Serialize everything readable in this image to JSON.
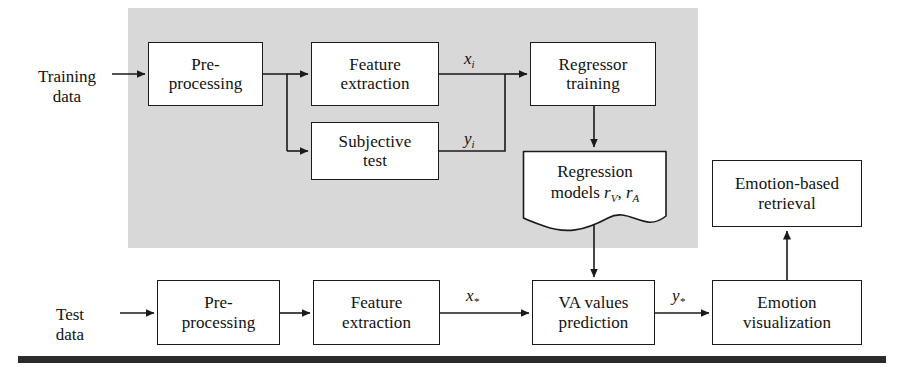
{
  "figure": {
    "type": "flowchart",
    "background_color": "#ffffff",
    "training_region_color": "#d8d8d8",
    "line_color": "#1a1a1a"
  },
  "regions": [
    {
      "id": "training-region",
      "label": "training phase shaded area",
      "x": 128,
      "y": 8,
      "w": 570,
      "h": 240
    }
  ],
  "nodes": [
    {
      "id": "pre-processing-training",
      "label": "Pre-\nprocessing",
      "line1": "Pre-",
      "line2": "processing",
      "shape": "rect",
      "x": 148,
      "y": 42,
      "w": 115,
      "h": 64
    },
    {
      "id": "feature-extraction-training",
      "label": "Feature\nextraction",
      "line1": "Feature",
      "line2": "extraction",
      "shape": "rect",
      "x": 311,
      "y": 42,
      "w": 128,
      "h": 64
    },
    {
      "id": "subjective-test",
      "label": "Subjective\ntest",
      "line1": "Subjective",
      "line2": "test",
      "shape": "rect",
      "x": 311,
      "y": 122,
      "w": 128,
      "h": 58
    },
    {
      "id": "regressor-training",
      "label": "Regressor\ntraining",
      "line1": "Regressor",
      "line2": "training",
      "shape": "rect",
      "x": 530,
      "y": 42,
      "w": 126,
      "h": 64
    },
    {
      "id": "regression-models",
      "label": "Regression\nmodels rV, rA",
      "line1": "Regression",
      "line2": "models",
      "shape": "document",
      "x": 522,
      "y": 150,
      "w": 144,
      "h": 82
    },
    {
      "id": "emotion-based-retrieval",
      "label": "Emotion-based\nretrieval",
      "line1": "Emotion-based",
      "line2": "retrieval",
      "shape": "rect",
      "x": 712,
      "y": 160,
      "w": 150,
      "h": 67
    },
    {
      "id": "pre-processing-test",
      "label": "Pre-\nprocessing",
      "line1": "Pre-",
      "line2": "processing",
      "shape": "rect",
      "x": 157,
      "y": 280,
      "w": 123,
      "h": 65
    },
    {
      "id": "feature-extraction-test",
      "label": "Feature\nextraction",
      "line1": "Feature",
      "line2": "extraction",
      "shape": "rect",
      "x": 313,
      "y": 280,
      "w": 127,
      "h": 65
    },
    {
      "id": "va-values-prediction",
      "label": "VA values\nprediction",
      "line1": "VA values",
      "line2": "prediction",
      "shape": "rect",
      "x": 532,
      "y": 280,
      "w": 123,
      "h": 65
    },
    {
      "id": "emotion-visualization",
      "label": "Emotion\nvisualization",
      "line1": "Emotion",
      "line2": "visualization",
      "shape": "rect",
      "x": 712,
      "y": 280,
      "w": 150,
      "h": 65
    }
  ],
  "io_labels": [
    {
      "id": "training-data",
      "text": "Training\ndata",
      "line1": "Training",
      "line2": "data",
      "x": 22,
      "y": 48,
      "w": 90
    },
    {
      "id": "test-data",
      "text": "Test\ndata",
      "line1": "Test",
      "line2": "data",
      "x": 30,
      "y": 286,
      "w": 80
    }
  ],
  "variable_labels": [
    {
      "id": "x-i",
      "base": "x",
      "sub": "i",
      "x": 464,
      "y": 49
    },
    {
      "id": "y-i",
      "base": "y",
      "sub": "i",
      "x": 464,
      "y": 129
    },
    {
      "id": "x-star",
      "base": "x",
      "sub": "*",
      "x": 466,
      "y": 286
    },
    {
      "id": "y-star",
      "base": "y",
      "sub": "*",
      "x": 672,
      "y": 286
    }
  ],
  "regression_model_vars": {
    "prefix": "models ",
    "v1": "r",
    "v1sub": "V",
    "separator": ", ",
    "v2": "r",
    "v2sub": "A"
  },
  "edges": [
    {
      "id": "edge-training-data-to-preprocessing",
      "from": "training-data",
      "to": "pre-processing-training"
    },
    {
      "id": "edge-preprocessing-to-feature-extraction",
      "from": "pre-processing-training",
      "to": "feature-extraction-training"
    },
    {
      "id": "edge-preprocessing-to-subjective-test",
      "from": "pre-processing-training",
      "to": "subjective-test"
    },
    {
      "id": "edge-feature-extraction-to-regressor",
      "from": "feature-extraction-training",
      "to": "regressor-training",
      "label": "x-i"
    },
    {
      "id": "edge-subjective-test-to-regressor",
      "from": "subjective-test",
      "to": "regressor-training",
      "label": "y-i"
    },
    {
      "id": "edge-regressor-to-regression-models",
      "from": "regressor-training",
      "to": "regression-models"
    },
    {
      "id": "edge-regression-models-to-va-prediction",
      "from": "regression-models",
      "to": "va-values-prediction"
    },
    {
      "id": "edge-test-data-to-preprocessing",
      "from": "test-data",
      "to": "pre-processing-test"
    },
    {
      "id": "edge-preprocessing-test-to-feature-extraction",
      "from": "pre-processing-test",
      "to": "feature-extraction-test"
    },
    {
      "id": "edge-feature-extraction-to-va-prediction",
      "from": "feature-extraction-test",
      "to": "va-values-prediction",
      "label": "x-star"
    },
    {
      "id": "edge-va-prediction-to-emotion-visualization",
      "from": "va-values-prediction",
      "to": "emotion-visualization",
      "label": "y-star"
    },
    {
      "id": "edge-emotion-visualization-to-retrieval",
      "from": "emotion-visualization",
      "to": "emotion-based-retrieval"
    }
  ],
  "rule_bar": {
    "id": "bottom-rule",
    "x": 18,
    "y": 356,
    "w": 868,
    "h": 7,
    "color": "#2b2b2b"
  }
}
